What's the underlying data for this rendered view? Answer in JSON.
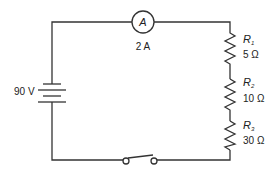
{
  "diagram": {
    "type": "series-circuit",
    "colors": {
      "wire": "#333333",
      "text": "#222222",
      "background": "#ffffff"
    },
    "battery": {
      "label": "90 V"
    },
    "ammeter": {
      "symbol": "A",
      "reading": "2 A"
    },
    "resistors": [
      {
        "name": "R",
        "subscript": "1",
        "value": "5 Ω"
      },
      {
        "name": "R",
        "subscript": "2",
        "value": "10 Ω"
      },
      {
        "name": "R",
        "subscript": "3",
        "value": "30 Ω"
      }
    ],
    "switch": {
      "state": "open"
    }
  }
}
